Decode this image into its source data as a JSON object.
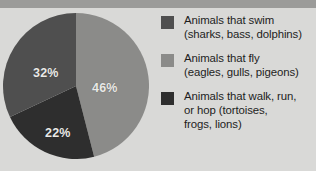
{
  "chart_data": {
    "type": "pie",
    "title": "",
    "categories": [
      "Animals that swim (sharks, bass, dolphins)",
      "Animals that fly (eagles, gulls, pigeons)",
      "Animals that walk, run, or hop (tortoises, frogs, lions)"
    ],
    "values": [
      22,
      46,
      32
    ],
    "value_labels": [
      "22%",
      "46%",
      "32%"
    ],
    "units": "percent",
    "legend_position": "right",
    "grid": false,
    "start_angle_deg": 0,
    "direction": "clockwise",
    "slice_order_clockwise_from_top": [
      "fly",
      "swim",
      "walk"
    ],
    "slices": [
      {
        "key": "fly",
        "label": "46%",
        "value": 46,
        "color": "#8b8b89"
      },
      {
        "key": "swim",
        "label": "22%",
        "value": 22,
        "color": "#2e2e2e"
      },
      {
        "key": "walk",
        "label": "32%",
        "value": 32,
        "color": "#4f4f4f"
      }
    ]
  },
  "legend": {
    "items": [
      {
        "color": "#4f4f4f",
        "line1": "Animals that swim",
        "line2": "(sharks, bass, dolphins)",
        "line3": ""
      },
      {
        "color": "#8b8b89",
        "line1": "Animals that fly",
        "line2": "(eagles, gulls, pigeons)",
        "line3": ""
      },
      {
        "color": "#2e2e2e",
        "line1": "Animals that walk, run,",
        "line2": "or hop (tortoises,",
        "line3": "frogs, lions)"
      }
    ]
  },
  "theme": {
    "background": "#d9d9d7",
    "top_band": "#9b9b99",
    "label_text": "#e9e9e7",
    "legend_text": "#1d1d1d"
  }
}
